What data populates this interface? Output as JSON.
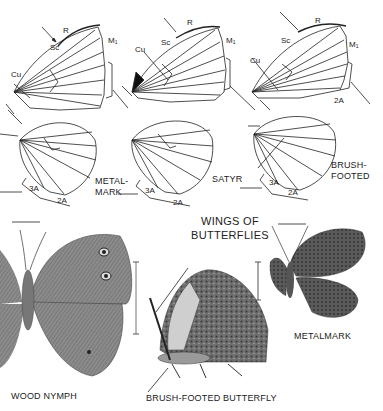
{
  "title": {
    "line1": "WINGS OF",
    "line2": "BUTTERFLIES"
  },
  "vein_labels": {
    "R": "R",
    "Sc": "Sc",
    "M": "M",
    "M_sub": "1",
    "Cu": "Cu",
    "A2": "2A",
    "A3": "3A"
  },
  "wing_diagrams": [
    {
      "id": "metalmark",
      "label_line1": "METAL-",
      "label_line2": "MARK"
    },
    {
      "id": "satyr",
      "label_line1": "SATYR",
      "label_line2": ""
    },
    {
      "id": "brush-footed",
      "label_line1": "BRUSH-",
      "label_line2": "FOOTED"
    }
  ],
  "specimens": [
    {
      "id": "wood-nymph",
      "caption": "WOOD NYMPH"
    },
    {
      "id": "brush-footed-butterfly",
      "caption": "BRUSH-FOOTED BUTTERFLY"
    },
    {
      "id": "metalmark",
      "caption": "METALMARK"
    }
  ],
  "colors": {
    "ink": "#222222",
    "wing_gray": "#8a8a8a",
    "wing_dark": "#555555",
    "paper": "#ffffff"
  }
}
